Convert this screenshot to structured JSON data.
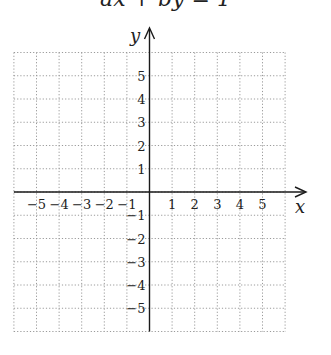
{
  "title": "ax + by = 1",
  "chart_data": {
    "type": "line",
    "title": "ax + by = 1",
    "xlabel": "x",
    "ylabel": "y",
    "xlim": [
      -5.5,
      5.5
    ],
    "ylim": [
      -5.5,
      5.5
    ],
    "x_ticks": [
      -5,
      -4,
      -3,
      -2,
      -1,
      1,
      2,
      3,
      4,
      5
    ],
    "y_ticks": [
      5,
      4,
      3,
      2,
      1,
      -1,
      -2,
      -3,
      -4,
      -5
    ],
    "x_tick_labels": [
      "−5",
      "−4",
      "−3",
      "−2",
      "−1",
      "1",
      "2",
      "3",
      "4",
      "5"
    ],
    "y_tick_labels": [
      "5",
      "4",
      "3",
      "2",
      "1",
      "−1",
      "−2",
      "−3",
      "−4",
      "−5"
    ],
    "grid": true,
    "grid_style": "dotted",
    "series": []
  },
  "colors": {
    "axis": "#1a1a1a",
    "grid": "#9a9a9a",
    "text": "#222222"
  }
}
